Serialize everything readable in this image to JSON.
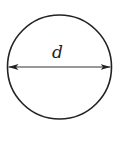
{
  "diagram": {
    "shape": "circle",
    "dimension_label": "d",
    "dimension_type": "diameter",
    "stroke_color": "#222222",
    "background_color": "#ffffff"
  }
}
